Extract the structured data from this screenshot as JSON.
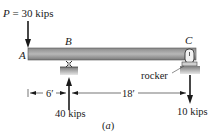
{
  "diagram": {
    "load": {
      "symbol": "P",
      "label": "P = 30 kips",
      "value": "30 kips"
    },
    "points": {
      "A": "A",
      "B": "B",
      "C": "C"
    },
    "supports": {
      "rocker_label": "rocker"
    },
    "reactions": {
      "B": "40 kips",
      "C": "10 kips"
    },
    "dimensions": {
      "AB": "6′",
      "BC": "18′"
    },
    "caption": "(a)"
  },
  "colors": {
    "beam_dark": "#6e6e6e",
    "beam_light": "#b5b5b5",
    "ink": "#1a1a1a",
    "ground": "#9a9a9a"
  }
}
